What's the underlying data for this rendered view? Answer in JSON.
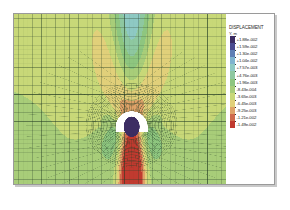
{
  "figure": {
    "kind": "fea-contour-plot",
    "background_color": "#ffffff",
    "frame_color": "#9a9a9a"
  },
  "legend": {
    "title": "DISPLACEMENT",
    "subtitle": "Y, m",
    "entries": [
      {
        "label": "+1.88e-002",
        "color": "#3c2d63"
      },
      {
        "label": "+1.59e-002",
        "color": "#4a4a8f"
      },
      {
        "label": "+1.30e-002",
        "color": "#5f7fb5"
      },
      {
        "label": "+1.04e-002",
        "color": "#7fb4cf"
      },
      {
        "label": "+7.57e-003",
        "color": "#8ec9c3"
      },
      {
        "label": "+4.76e-003",
        "color": "#8ec8a0"
      },
      {
        "label": "+1.96e-003",
        "color": "#8ec67f"
      },
      {
        "label": "-8.43e-004",
        "color": "#a8cd79"
      },
      {
        "label": "-3.65e-003",
        "color": "#c8d878"
      },
      {
        "label": "-6.45e-003",
        "color": "#e1d07a"
      },
      {
        "label": "-9.25e-003",
        "color": "#dfa268"
      },
      {
        "label": "-1.21e-002",
        "color": "#cf6a4c"
      },
      {
        "label": "-1.49e-002",
        "color": "#c03a2f"
      }
    ]
  },
  "chart_data": {
    "type": "heatmap",
    "title": "DISPLACEMENT",
    "field": "Y, m",
    "xlabel": "",
    "ylabel": "",
    "grid": true,
    "legend_position": "right",
    "contour_levels": [
      0.0188,
      0.0159,
      0.013,
      0.0104,
      0.00757,
      0.00476,
      0.00196,
      -0.000843,
      -0.00365,
      -0.00645,
      -0.00925,
      -0.0121,
      -0.0149
    ],
    "value_range": [
      -0.0149,
      0.0188
    ],
    "units": "m",
    "colors": [
      "#3c2d63",
      "#4a4a8f",
      "#5f7fb5",
      "#7fb4cf",
      "#8ec9c3",
      "#8ec8a0",
      "#8ec67f",
      "#a8cd79",
      "#c8d878",
      "#e1d07a",
      "#dfa268",
      "#cf6a4c",
      "#c03a2f"
    ],
    "features": {
      "tunnel_lining": "white arch",
      "tunnel_core": "#3c2d63",
      "far_field": "#8ec67f",
      "crown_plume": "orange-to-red band above opening",
      "invert_bulb": "blue band below opening"
    }
  }
}
